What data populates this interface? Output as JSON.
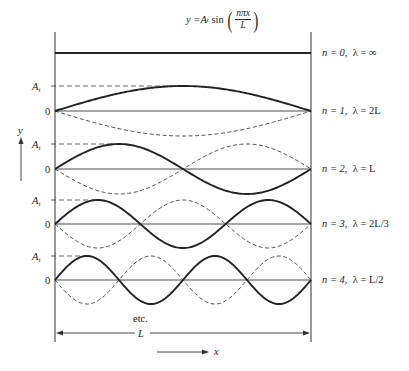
{
  "equation": {
    "lhs": "y = ",
    "amplitude": "A",
    "amplitude_sub": "t",
    "func": " sin ",
    "numerator": "nπx",
    "denominator": "L"
  },
  "axis_labels": {
    "y": "y",
    "x": "x",
    "length": "L",
    "etc": "etc.",
    "amplitude": "A",
    "amplitude_sub": "t",
    "zero": "0"
  },
  "modes": [
    {
      "n": 0,
      "label_n": "n = 0,",
      "label_lambda": "λ = ∞",
      "zero_y": 53,
      "amplitude": 0
    },
    {
      "n": 1,
      "label_n": "n = 1,",
      "label_lambda": "λ = 2L",
      "zero_y": 111,
      "amplitude": 25
    },
    {
      "n": 2,
      "label_n": "n = 2,",
      "label_lambda": "λ = L",
      "zero_y": 169,
      "amplitude": 25
    },
    {
      "n": 3,
      "label_n": "n = 3,",
      "label_lambda": "λ = 2L/3",
      "zero_y": 224,
      "amplitude": 24
    },
    {
      "n": 4,
      "label_n": "n = 4,",
      "label_lambda": "λ = L/2",
      "zero_y": 280,
      "amplitude": 24
    }
  ],
  "colors": {
    "line": "#222222",
    "background": "#ffffff"
  }
}
